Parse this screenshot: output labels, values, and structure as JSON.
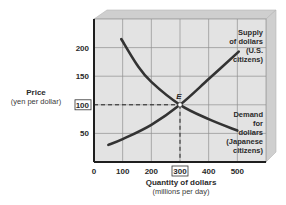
{
  "chart_data": {
    "type": "line",
    "title": "",
    "xlabel": "Quantity of dollars",
    "xlabel_sub": "(millions per day)",
    "ylabel": "Price",
    "ylabel_sub": "(yen per dollar)",
    "xlim": [
      0,
      600
    ],
    "ylim": [
      0,
      250
    ],
    "x_ticks": [
      0,
      100,
      200,
      300,
      400,
      500
    ],
    "y_ticks": [
      50,
      100,
      150,
      200
    ],
    "highlighted_x_tick": 300,
    "highlighted_y_tick": 100,
    "grid": true,
    "series": [
      {
        "name": "Supply of dollars (U.S. citizens)",
        "label_lines": [
          "Supply",
          "of dollars",
          "(U.S.",
          "citizens)"
        ],
        "points": [
          [
            50,
            30
          ],
          [
            100,
            40
          ],
          [
            200,
            65
          ],
          [
            300,
            100
          ],
          [
            400,
            145
          ],
          [
            505,
            193
          ]
        ]
      },
      {
        "name": "Demand for dollars (Japanese citizens)",
        "label_lines": [
          "Demand",
          "for",
          "dollars",
          "(Japanese",
          "citizens)"
        ],
        "points": [
          [
            95,
            215
          ],
          [
            150,
            170
          ],
          [
            200,
            140
          ],
          [
            300,
            100
          ],
          [
            400,
            75
          ],
          [
            500,
            55
          ]
        ]
      }
    ],
    "annotations": [
      {
        "label": "E",
        "x": 300,
        "y": 100,
        "note": "equilibrium point, dashed guide lines to both axes"
      }
    ]
  },
  "colors": {
    "plot_bg": "#e3e3e3",
    "bevel": "#cfcfcf",
    "grid": "#8f8f8f",
    "axis": "#1e1e1e",
    "curve": "#333333"
  }
}
